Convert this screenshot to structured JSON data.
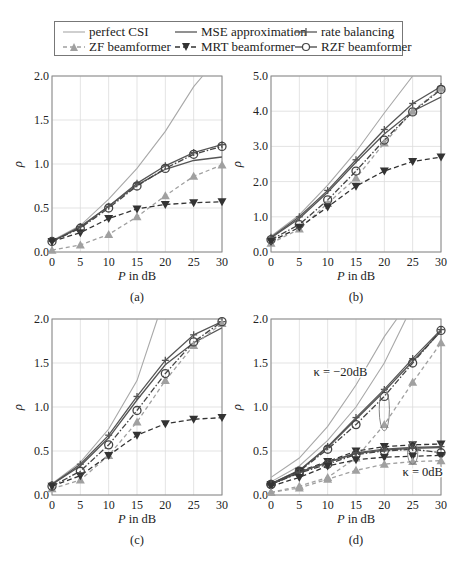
{
  "legend": {
    "items": [
      {
        "label": "perfect CSI",
        "key": "perfect"
      },
      {
        "label": "MSE approximation",
        "key": "mse"
      },
      {
        "label": "rate balancing",
        "key": "rate"
      },
      {
        "label": "ZF beamformer",
        "key": "zf"
      },
      {
        "label": "MRT beamformer",
        "key": "mrt"
      },
      {
        "label": "RZF beamformer",
        "key": "rzf"
      }
    ]
  },
  "styles": {
    "perfect": {
      "color": "#a8a8a8",
      "dash": "",
      "width": 1.1,
      "marker": "none"
    },
    "mse": {
      "color": "#555555",
      "dash": "",
      "width": 1.3,
      "marker": "none"
    },
    "rate": {
      "color": "#555555",
      "dash": "",
      "width": 1.3,
      "marker": "plus"
    },
    "zf": {
      "color": "#a0a0a0",
      "dash": "4,3",
      "width": 1.3,
      "marker": "triangle-up"
    },
    "mrt": {
      "color": "#333333",
      "dash": "5,3",
      "width": 1.3,
      "marker": "triangle-down"
    },
    "rzf": {
      "color": "#444444",
      "dash": "6,2,1.5,2",
      "width": 1.3,
      "marker": "circle"
    }
  },
  "chart_data": [
    {
      "type": "line",
      "panel_label": "(a)",
      "xlabel": "P in dB",
      "ylabel": "ρ",
      "x": [
        0,
        5,
        10,
        15,
        20,
        25,
        30
      ],
      "xticks": [
        "0",
        "5",
        "10",
        "15",
        "20",
        "25",
        "30"
      ],
      "yticks": [
        "0.0",
        "0.5",
        "1.0",
        "1.5",
        "2.0"
      ],
      "ylim": [
        0,
        2.0
      ],
      "grid": true,
      "series": [
        {
          "name": "perfect CSI",
          "key": "perfect",
          "x": [
            0,
            5,
            10,
            15,
            20,
            25,
            26.6
          ],
          "values": [
            0.13,
            0.3,
            0.6,
            0.95,
            1.37,
            1.88,
            2.0
          ]
        },
        {
          "name": "MSE approximation",
          "key": "mse",
          "values": [
            0.12,
            0.28,
            0.52,
            0.76,
            0.94,
            1.04,
            1.08
          ]
        },
        {
          "name": "rate balancing",
          "key": "rate",
          "values": [
            0.12,
            0.29,
            0.52,
            0.78,
            0.98,
            1.13,
            1.22
          ]
        },
        {
          "name": "ZF beamformer",
          "key": "zf",
          "values": [
            0.02,
            0.08,
            0.2,
            0.4,
            0.64,
            0.86,
            0.99
          ]
        },
        {
          "name": "MRT beamformer",
          "key": "mrt",
          "values": [
            0.12,
            0.22,
            0.38,
            0.49,
            0.54,
            0.56,
            0.57
          ]
        },
        {
          "name": "RZF beamformer",
          "key": "rzf",
          "values": [
            0.12,
            0.27,
            0.5,
            0.75,
            0.95,
            1.11,
            1.2
          ]
        }
      ]
    },
    {
      "type": "line",
      "panel_label": "(b)",
      "xlabel": "P in dB",
      "ylabel": "ρ",
      "x": [
        0,
        5,
        10,
        15,
        20,
        25,
        30
      ],
      "xticks": [
        "0",
        "5",
        "10",
        "15",
        "20",
        "25",
        "30"
      ],
      "yticks": [
        "0.0",
        "1.0",
        "2.0",
        "3.0",
        "4.0",
        "5.0"
      ],
      "ylim": [
        0,
        5.0
      ],
      "grid": true,
      "series": [
        {
          "name": "perfect CSI",
          "key": "perfect",
          "x": [
            0,
            5,
            10,
            15,
            20,
            25
          ],
          "values": [
            0.45,
            1.05,
            1.9,
            2.85,
            3.95,
            5.0
          ]
        },
        {
          "name": "MSE approximation",
          "key": "mse",
          "values": [
            0.4,
            0.95,
            1.7,
            2.55,
            3.35,
            4.0,
            4.4
          ]
        },
        {
          "name": "rate balancing",
          "key": "rate",
          "values": [
            0.42,
            1.0,
            1.75,
            2.62,
            3.48,
            4.22,
            4.7
          ]
        },
        {
          "name": "ZF beamformer",
          "key": "zf",
          "values": [
            0.25,
            0.65,
            1.38,
            2.1,
            3.1,
            4.0,
            4.65
          ]
        },
        {
          "name": "MRT beamformer",
          "key": "mrt",
          "values": [
            0.3,
            0.7,
            1.28,
            1.87,
            2.3,
            2.57,
            2.7
          ]
        },
        {
          "name": "RZF beamformer",
          "key": "rzf",
          "values": [
            0.35,
            0.78,
            1.48,
            2.3,
            3.18,
            3.98,
            4.62
          ]
        }
      ]
    },
    {
      "type": "line",
      "panel_label": "(c)",
      "xlabel": "P in dB",
      "ylabel": "ρ",
      "x": [
        0,
        5,
        10,
        15,
        20,
        25,
        30
      ],
      "xticks": [
        "0",
        "5",
        "10",
        "15",
        "20",
        "25",
        "30"
      ],
      "yticks": [
        "0.0",
        "0.5",
        "1.0",
        "1.5",
        "2.0"
      ],
      "ylim": [
        0,
        2.0
      ],
      "grid": true,
      "series": [
        {
          "name": "perfect CSI",
          "key": "perfect",
          "x": [
            0,
            5,
            10,
            15,
            18.6
          ],
          "values": [
            0.13,
            0.37,
            0.75,
            1.3,
            2.0
          ]
        },
        {
          "name": "MSE approximation",
          "key": "mse",
          "values": [
            0.12,
            0.33,
            0.65,
            1.08,
            1.48,
            1.73,
            1.9
          ]
        },
        {
          "name": "rate balancing",
          "key": "rate",
          "values": [
            0.12,
            0.35,
            0.68,
            1.12,
            1.53,
            1.82,
            1.97
          ]
        },
        {
          "name": "ZF beamformer",
          "key": "zf",
          "values": [
            0.07,
            0.17,
            0.45,
            0.83,
            1.3,
            1.7,
            1.95
          ]
        },
        {
          "name": "MRT beamformer",
          "key": "mrt",
          "values": [
            0.1,
            0.22,
            0.45,
            0.68,
            0.81,
            0.86,
            0.88
          ]
        },
        {
          "name": "RZF beamformer",
          "key": "rzf",
          "values": [
            0.1,
            0.27,
            0.57,
            0.96,
            1.38,
            1.74,
            1.97
          ]
        }
      ]
    },
    {
      "type": "line",
      "panel_label": "(d)",
      "xlabel": "P in dB",
      "ylabel": "ρ",
      "x": [
        0,
        5,
        10,
        15,
        20,
        25,
        30
      ],
      "xticks": [
        "0",
        "5",
        "10",
        "15",
        "20",
        "25",
        "30"
      ],
      "yticks": [
        "0.0",
        "0.5",
        "1.0",
        "1.5",
        "2.0"
      ],
      "ylim": [
        0,
        2.0
      ],
      "grid": true,
      "annotations": [
        {
          "text": "κ = −20dB",
          "x": 7.5,
          "y": 1.35
        },
        {
          "text": "κ = 0dB",
          "x": 23.2,
          "y": 0.22
        }
      ],
      "ellipses": [
        {
          "cx": 20,
          "cy": 0.97,
          "rx": 0.9,
          "ry": 0.24
        },
        {
          "cx": 25,
          "cy": 0.48,
          "rx": 0.9,
          "ry": 0.13
        }
      ],
      "series": [
        {
          "name": "perfect CSI (κ = −20dB)",
          "key": "perfect",
          "x": [
            0,
            5,
            10,
            15,
            20,
            22.2
          ],
          "values": [
            0.2,
            0.42,
            0.78,
            1.25,
            1.8,
            2.0
          ]
        },
        {
          "name": "perfect CSI (κ = 0dB)",
          "key": "perfect",
          "x": [
            0,
            5,
            10,
            15,
            20,
            23.8
          ],
          "values": [
            0.15,
            0.33,
            0.62,
            1.0,
            1.5,
            2.0
          ]
        },
        {
          "name": "MSE approximation (κ = −20dB)",
          "key": "mse",
          "values": [
            0.13,
            0.28,
            0.54,
            0.86,
            1.18,
            1.52,
            1.86
          ]
        },
        {
          "name": "rate balancing (κ = −20dB)",
          "key": "rate",
          "values": [
            0.13,
            0.28,
            0.55,
            0.88,
            1.2,
            1.55,
            1.88
          ]
        },
        {
          "name": "ZF beamformer (κ = −20dB)",
          "key": "zf",
          "values": [
            0.03,
            0.1,
            0.2,
            0.42,
            0.8,
            1.28,
            1.73
          ]
        },
        {
          "name": "RZF beamformer (κ = −20dB)",
          "key": "rzf",
          "values": [
            0.12,
            0.27,
            0.52,
            0.8,
            1.12,
            1.5,
            1.87
          ]
        },
        {
          "name": "MRT beamformer (κ = −20dB)",
          "key": "mrt",
          "values": [
            0.12,
            0.27,
            0.38,
            0.5,
            0.55,
            0.57,
            0.58
          ]
        },
        {
          "name": "MSE approximation (κ = 0dB)",
          "key": "mse",
          "values": [
            0.12,
            0.26,
            0.37,
            0.47,
            0.51,
            0.53,
            0.54
          ]
        },
        {
          "name": "rate balancing (κ = 0dB)",
          "key": "rate",
          "values": [
            0.12,
            0.26,
            0.37,
            0.48,
            0.52,
            0.54,
            0.55
          ]
        },
        {
          "name": "RZF beamformer (κ = 0dB)",
          "key": "rzf",
          "values": [
            0.12,
            0.25,
            0.35,
            0.46,
            0.5,
            0.52,
            0.48
          ]
        },
        {
          "name": "MRT beamformer (κ = 0dB)",
          "key": "mrt",
          "values": [
            0.1,
            0.2,
            0.33,
            0.4,
            0.43,
            0.44,
            0.45
          ]
        },
        {
          "name": "ZF beamformer (κ = 0dB)",
          "key": "zf",
          "values": [
            0.03,
            0.08,
            0.18,
            0.28,
            0.35,
            0.38,
            0.39
          ]
        }
      ]
    }
  ],
  "caption_partial": "Fig. 4.11  Sum-rate..."
}
